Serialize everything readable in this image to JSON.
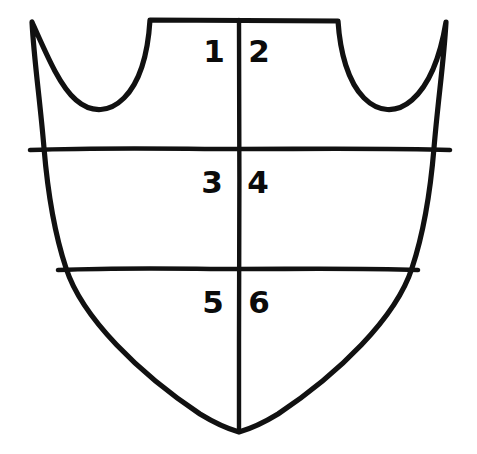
{
  "figure": {
    "name": "heraldic-shield-division-diagram",
    "background_color": "#ffffff",
    "ink_color": "#111111",
    "width": 477,
    "height": 454
  },
  "shield": {
    "outline_name": "shield-outline",
    "style": "hand-drawn",
    "center_line_x": 239,
    "point_y": 432,
    "top_edge_y": 20,
    "horn_left_x": 32,
    "horn_right_x": 448
  },
  "dividers": {
    "vertical": {
      "label": "pale-line",
      "x": 239,
      "y_start": 20,
      "y_end": 432
    },
    "horizontal": [
      {
        "label": "upper-fess-line",
        "y": 150,
        "x_start": 30,
        "x_end": 450
      },
      {
        "label": "lower-fess-line",
        "y": 270,
        "x_start": 58,
        "x_end": 418
      }
    ]
  },
  "compartments": [
    {
      "id": "1",
      "number": "1",
      "row": "chief",
      "side": "dexter",
      "x": 214,
      "y": 62
    },
    {
      "id": "2",
      "number": "2",
      "row": "chief",
      "side": "sinister",
      "x": 259,
      "y": 62
    },
    {
      "id": "3",
      "number": "3",
      "row": "fess",
      "side": "dexter",
      "x": 212,
      "y": 193
    },
    {
      "id": "4",
      "number": "4",
      "row": "fess",
      "side": "sinister",
      "x": 258,
      "y": 193
    },
    {
      "id": "5",
      "number": "5",
      "row": "base",
      "side": "dexter",
      "x": 213,
      "y": 313
    },
    {
      "id": "6",
      "number": "6",
      "row": "base",
      "side": "sinister",
      "x": 259,
      "y": 313
    }
  ]
}
